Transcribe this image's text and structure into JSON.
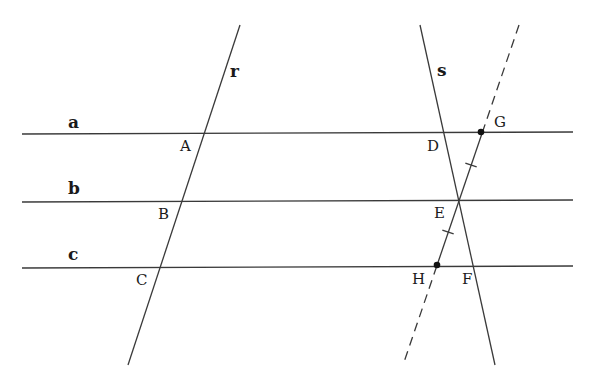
{
  "diagram": {
    "stroke_color": "#3a3a3a",
    "parallel_lines": [
      {
        "name": "a",
        "label": "a",
        "x1": 22,
        "y1": 134,
        "x2": 573,
        "y2": 132,
        "label_x": 68,
        "label_y": 128
      },
      {
        "name": "b",
        "label": "b",
        "x1": 22,
        "y1": 202,
        "x2": 573,
        "y2": 200,
        "label_x": 68,
        "label_y": 194
      },
      {
        "name": "c",
        "label": "c",
        "x1": 22,
        "y1": 268,
        "x2": 573,
        "y2": 266,
        "label_x": 68,
        "label_y": 260
      }
    ],
    "transversals": [
      {
        "name": "r",
        "label": "r",
        "x1": 240,
        "y1": 25,
        "x2": 128,
        "y2": 365,
        "label_x": 230,
        "label_y": 77,
        "dashed": false
      },
      {
        "name": "s",
        "label": "s",
        "x1": 420,
        "y1": 25,
        "x2": 495,
        "y2": 365,
        "label_x": 437,
        "label_y": 76,
        "dashed": false
      }
    ],
    "dashed_line": {
      "x1": 519,
      "y1": 25,
      "x2": 403,
      "y2": 365,
      "solid_from_y": 132,
      "solid_to_y": 266
    },
    "points": [
      {
        "label": "A",
        "label_x": 180,
        "label_y": 151,
        "dot": false
      },
      {
        "label": "B",
        "label_x": 158,
        "label_y": 219,
        "dot": false
      },
      {
        "label": "C",
        "label_x": 136,
        "label_y": 285,
        "dot": false
      },
      {
        "label": "D",
        "label_x": 427,
        "label_y": 151,
        "dot": false
      },
      {
        "label": "E",
        "label_x": 434,
        "label_y": 218,
        "dot": false
      },
      {
        "label": "F",
        "label_x": 462,
        "label_y": 284,
        "dot": false
      },
      {
        "label": "G",
        "label_x": 494,
        "label_y": 127,
        "dot": true,
        "x": 481,
        "y": 132
      },
      {
        "label": "H",
        "label_x": 412,
        "label_y": 284,
        "dot": true,
        "x": 437,
        "y": 265
      }
    ],
    "tick_marks": [
      {
        "segment": "GE",
        "x": 471,
        "y": 165
      },
      {
        "segment": "EH",
        "x": 448,
        "y": 232
      }
    ]
  }
}
